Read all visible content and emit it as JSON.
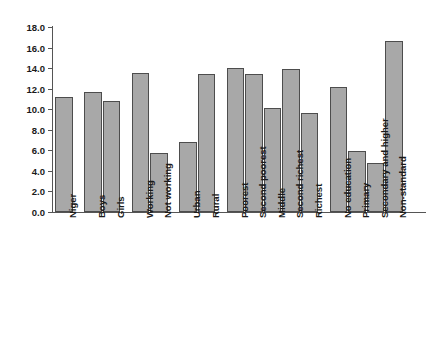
{
  "chart_data": {
    "type": "bar",
    "title": "",
    "subtitle": "",
    "xlabel": "",
    "ylabel": "",
    "ylim": [
      0.0,
      18.0
    ],
    "ytick_step": 2.0,
    "ytick_labels": [
      "18.0",
      "16.0",
      "14.0",
      "12.0",
      "10.0",
      "8.0",
      "6.0",
      "4.0",
      "2.0",
      "0.0"
    ],
    "ytick_values": [
      18.0,
      16.0,
      14.0,
      12.0,
      10.0,
      8.0,
      6.0,
      4.0,
      2.0,
      0.0
    ],
    "grid": false,
    "legend": "none",
    "bar_color": "#a8a8a8",
    "bar_edge_color": "#4d4d4d",
    "axis_color": "#555555",
    "categories": [
      "Niger",
      "Boys",
      "Girls",
      "Working",
      "Not working",
      "Urban",
      "Rural",
      "Poorest",
      "Second poorest",
      "Middle",
      "Second richest",
      "Richest",
      "No education",
      "Primary",
      "Secondary and higher",
      "Non-standard"
    ],
    "values": [
      11.2,
      11.7,
      10.8,
      13.5,
      5.7,
      6.8,
      13.4,
      14.0,
      13.4,
      10.1,
      13.9,
      9.6,
      12.2,
      5.9,
      4.8,
      16.6
    ],
    "groups": [
      {
        "name": "National",
        "categories": [
          "Niger"
        ]
      },
      {
        "name": "Sex",
        "categories": [
          "Boys",
          "Girls"
        ]
      },
      {
        "name": "Work status",
        "categories": [
          "Working",
          "Not working"
        ]
      },
      {
        "name": "Residence",
        "categories": [
          "Urban",
          "Rural"
        ]
      },
      {
        "name": "Wealth quintile",
        "categories": [
          "Poorest",
          "Second poorest",
          "Middle",
          "Second richest",
          "Richest"
        ]
      },
      {
        "name": "Mother's education",
        "categories": [
          "No education",
          "Primary",
          "Secondary and higher",
          "Non-standard"
        ]
      }
    ]
  }
}
